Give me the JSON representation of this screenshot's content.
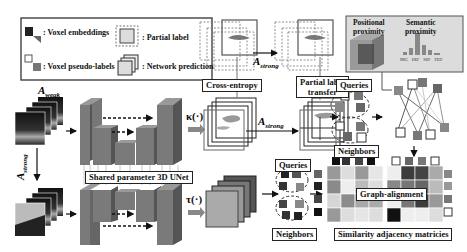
{
  "legend": {
    "voxel_embeddings": ": Voxel embeddings",
    "voxel_pseudo_labels": ": Voxel pseudo-labels",
    "partial_label": ": Partial label",
    "network_prediction": ": Network prediction"
  },
  "augment": {
    "weak": "A",
    "weak_sub": "weak",
    "strong": "A",
    "strong_sub": "strong"
  },
  "unet": {
    "label": "Shared parameter 3D UNet"
  },
  "heads": {
    "kappa": "κ(·)",
    "tau": "τ(·)"
  },
  "boxes": {
    "cross_entropy": "Cross-entropy",
    "partial_label_transfer_1": "Partial label",
    "partial_label_transfer_2": "transfer",
    "queries_top": "Queries",
    "neighbors_top": "Neighbors",
    "queries_bottom": "Queries",
    "neighbors_bottom": "Neighbors",
    "graph_alignment": "Graph-alignment",
    "similarity": "Similarity adjacency matricies"
  },
  "proximity": {
    "positional_1": "Positional",
    "positional_2": "proximity",
    "semantic_1": "Semantic",
    "semantic_2": "proximity",
    "bar_labels": [
      "IMG",
      "EKF",
      "SRF",
      "PED"
    ]
  },
  "colors": {
    "unet_fill": "#7a7a7a",
    "unet_dark": "#555555",
    "proximity_bg": "#d8d8d8",
    "matrix_dark": "#3c3c3c",
    "matrix_mid": "#8c8c8c",
    "matrix_light": "#e0e0e0"
  }
}
